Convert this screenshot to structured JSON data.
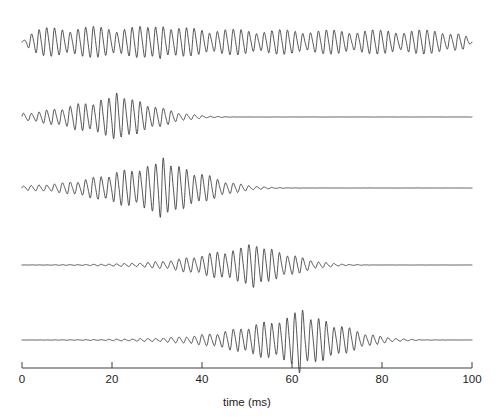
{
  "figure": {
    "title": "",
    "background_color": "#ffffff",
    "trace_color": "#2b2b2b",
    "axis_color": "#2b2b2b",
    "width": 501,
    "height": 419
  },
  "axis": {
    "x_title": "time (ms)",
    "x_tick_labels": [
      "0",
      "20",
      "40",
      "60",
      "80",
      "100"
    ],
    "x_tick_values": [
      0,
      20,
      40,
      60,
      80,
      100
    ],
    "x_min": 0,
    "x_max": 100,
    "x_pixel_left": 22,
    "x_pixel_right": 472,
    "axis_pixel_y": 368,
    "tick_length": 6,
    "ticks_direction": "up",
    "y_axis_shown": false,
    "grid": false
  },
  "chart_data": {
    "type": "line",
    "title": "",
    "xlabel": "time (ms)",
    "ylabel": "",
    "xlim": [
      0,
      100
    ],
    "legend": "none",
    "grid": false,
    "series": [
      {
        "name": "trace-1",
        "baseline_pixel_y": 42,
        "envelope_center_ms": 50,
        "envelope_width_ms": 120,
        "peak_amplitude_px": 19,
        "spike_center_ms": 31,
        "spike_amplitude_px": 21,
        "carrier_frequency_khz": 0.58,
        "modulation_period_ms": 10.5,
        "continuous": true,
        "start_ms": 0,
        "end_ms": 100
      },
      {
        "name": "trace-2",
        "baseline_pixel_y": 117,
        "envelope_center_ms": 22,
        "envelope_width_ms": 17,
        "peak_amplitude_px": 17,
        "spike_center_ms": 21.5,
        "spike_amplitude_px": 20,
        "carrier_frequency_khz": 0.58,
        "modulation_period_ms": 10.5,
        "continuous": false,
        "start_ms": 0,
        "end_ms": 100
      },
      {
        "name": "trace-3",
        "baseline_pixel_y": 188,
        "envelope_center_ms": 32,
        "envelope_width_ms": 19,
        "peak_amplitude_px": 21,
        "spike_center_ms": 31.5,
        "spike_amplitude_px": 26,
        "carrier_frequency_khz": 0.58,
        "modulation_period_ms": 10.5,
        "continuous": false,
        "start_ms": 0,
        "end_ms": 100
      },
      {
        "name": "trace-4",
        "baseline_pixel_y": 265,
        "envelope_center_ms": 52,
        "envelope_width_ms": 17,
        "peak_amplitude_px": 16,
        "spike_center_ms": 51.5,
        "spike_amplitude_px": 19,
        "carrier_frequency_khz": 0.58,
        "modulation_period_ms": 10.5,
        "continuous": false,
        "start_ms": 0,
        "end_ms": 100
      },
      {
        "name": "trace-5",
        "baseline_pixel_y": 340,
        "envelope_center_ms": 63,
        "envelope_width_ms": 19,
        "peak_amplitude_px": 21,
        "spike_center_ms": 62,
        "spike_amplitude_px": 27,
        "carrier_frequency_khz": 0.58,
        "modulation_period_ms": 10.5,
        "continuous": false,
        "start_ms": 0,
        "end_ms": 100
      }
    ]
  }
}
